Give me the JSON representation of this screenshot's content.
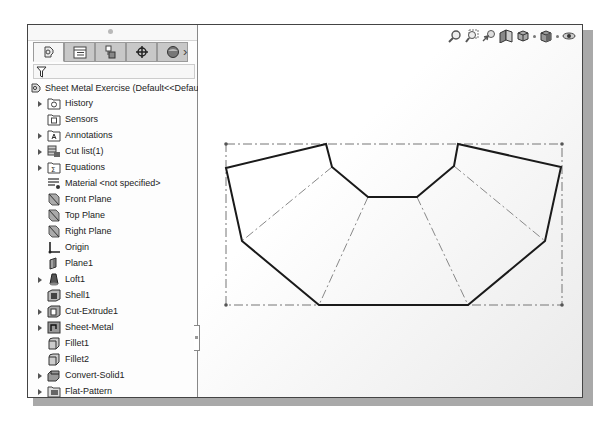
{
  "sidebar": {
    "tabs": [
      {
        "name": "feature-manager-tab",
        "icon": "feature-tree-icon",
        "active": true
      },
      {
        "name": "property-manager-tab",
        "icon": "property-list-icon",
        "active": false
      },
      {
        "name": "configuration-manager-tab",
        "icon": "configuration-icon",
        "active": false
      },
      {
        "name": "dimxpert-manager-tab",
        "icon": "crosshair-target-icon",
        "active": false
      },
      {
        "name": "display-manager-tab",
        "icon": "appearance-sphere-icon",
        "active": false
      }
    ],
    "more_tabs_label": "›",
    "filter_icon": "filter-funnel-icon",
    "root": {
      "label": "Sheet Metal Exercise  (Default<<Default",
      "icon": "part-icon"
    },
    "items": [
      {
        "label": "History",
        "icon": "history-folder-icon",
        "expandable": true
      },
      {
        "label": "Sensors",
        "icon": "sensors-folder-icon",
        "expandable": false
      },
      {
        "label": "Annotations",
        "icon": "annotations-folder-icon",
        "expandable": true
      },
      {
        "label": "Cut list(1)",
        "icon": "cut-list-icon",
        "expandable": true
      },
      {
        "label": "Equations",
        "icon": "equations-folder-icon",
        "expandable": true
      },
      {
        "label": "Material <not specified>",
        "icon": "material-icon",
        "expandable": false
      },
      {
        "label": "Front Plane",
        "icon": "plane-icon",
        "expandable": false
      },
      {
        "label": "Top Plane",
        "icon": "plane-icon",
        "expandable": false
      },
      {
        "label": "Right Plane",
        "icon": "plane-icon",
        "expandable": false
      },
      {
        "label": "Origin",
        "icon": "origin-icon",
        "expandable": false
      },
      {
        "label": "Plane1",
        "icon": "plane-feature-icon",
        "expandable": false
      },
      {
        "label": "Loft1",
        "icon": "loft-icon",
        "expandable": true
      },
      {
        "label": "Shell1",
        "icon": "shell-icon",
        "expandable": false
      },
      {
        "label": "Cut-Extrude1",
        "icon": "cut-extrude-icon",
        "expandable": true
      },
      {
        "label": "Sheet-Metal",
        "icon": "sheet-metal-icon",
        "expandable": true
      },
      {
        "label": "Fillet1",
        "icon": "fillet-icon",
        "expandable": false
      },
      {
        "label": "Fillet2",
        "icon": "fillet-icon",
        "expandable": false
      },
      {
        "label": "Convert-Solid1",
        "icon": "convert-solid-icon",
        "expandable": true
      },
      {
        "label": "Flat-Pattern",
        "icon": "flat-pattern-icon",
        "expandable": true
      }
    ]
  },
  "heads_up_toolbar": {
    "tools": [
      "zoom-to-fit-icon",
      "zoom-to-area-icon",
      "previous-view-icon",
      "section-view-icon",
      "view-orientation-icon",
      "display-style-icon",
      "hide-show-items-icon"
    ]
  },
  "viewport": {
    "flat_pattern": {
      "outline": [
        [
          225,
          167
        ],
        [
          325,
          143
        ],
        [
          331,
          166
        ],
        [
          367,
          196
        ],
        [
          416,
          196
        ],
        [
          453,
          165
        ],
        [
          457,
          143
        ],
        [
          560,
          166
        ],
        [
          544,
          240
        ],
        [
          467,
          304
        ],
        [
          318,
          304
        ],
        [
          241,
          240
        ]
      ],
      "bend_lines": [
        [
          [
            331,
            166
          ],
          [
            241,
            240
          ]
        ],
        [
          [
            367,
            196
          ],
          [
            318,
            304
          ]
        ],
        [
          [
            416,
            196
          ],
          [
            467,
            304
          ]
        ],
        [
          [
            453,
            165
          ],
          [
            544,
            240
          ]
        ]
      ],
      "bounding_box": [
        [
          225,
          143
        ],
        [
          561,
          304
        ]
      ]
    }
  }
}
